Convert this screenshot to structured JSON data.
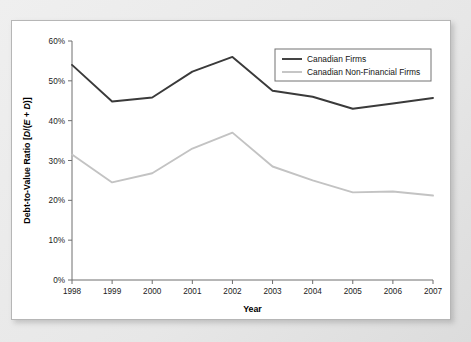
{
  "chart_data": {
    "type": "line",
    "title": "",
    "xlabel": "Year",
    "ylabel": "Debt-to-Value Ratio [D/(E + D)]",
    "ylabel_parts": {
      "prefix": "Debt-to-Value Ratio [",
      "d1": "D",
      "slash": "/(",
      "e": "E",
      "plus": " + ",
      "d2": "D",
      "suffix": ")]"
    },
    "categories": [
      "1998",
      "1999",
      "2000",
      "2001",
      "2002",
      "2003",
      "2004",
      "2005",
      "2006",
      "2007"
    ],
    "x": [
      1998,
      1999,
      2000,
      2001,
      2002,
      2003,
      2004,
      2005,
      2006,
      2007
    ],
    "xlim": [
      1998,
      2007
    ],
    "ylim": [
      0,
      60
    ],
    "ytick_labels": [
      "0%",
      "10%",
      "20%",
      "30%",
      "40%",
      "50%",
      "60%"
    ],
    "ytick_values": [
      0,
      10,
      20,
      30,
      40,
      50,
      60
    ],
    "grid": false,
    "legend_position": "top-right",
    "series": [
      {
        "name": "Canadian Firms",
        "color": "#3a3a3a",
        "width": 1.9,
        "values": [
          54.0,
          44.8,
          45.8,
          52.3,
          56.0,
          47.5,
          46.0,
          43.0,
          44.3,
          45.7
        ]
      },
      {
        "name": "Canadian Non-Financial Firms",
        "color": "#c3c3c3",
        "width": 1.9,
        "values": [
          31.5,
          24.5,
          26.8,
          33.0,
          37.0,
          28.5,
          25.0,
          22.0,
          22.2,
          21.2
        ]
      }
    ]
  },
  "figure": {
    "background_color": "#e9e9e9",
    "panel_color": "#ffffff",
    "frame_color": "#b6b6b6"
  }
}
